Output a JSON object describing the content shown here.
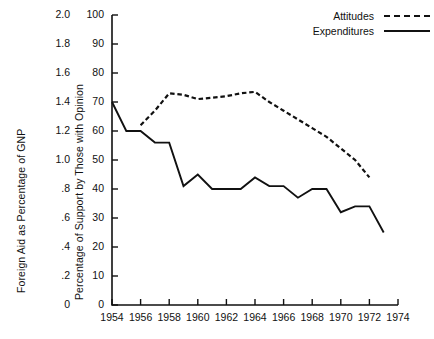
{
  "chart_data": {
    "type": "line",
    "title": "",
    "xlabel": "",
    "ylabel": "Foreign Aid as Percentage of GNP",
    "ylabel_right": "Percentage of Support by Those with Opinion",
    "x": [
      1954,
      1955,
      1956,
      1957,
      1958,
      1959,
      1960,
      1961,
      1962,
      1963,
      1964,
      1965,
      1966,
      1967,
      1968,
      1969,
      1970,
      1971,
      1972,
      1973,
      1974
    ],
    "xlim": [
      1954,
      1974
    ],
    "xticks": [
      "1954",
      "1956",
      "1958",
      "1960",
      "1962",
      "1964",
      "1966",
      "1968",
      "1970",
      "1972",
      "1974"
    ],
    "xtick_values": [
      1954,
      1956,
      1958,
      1960,
      1962,
      1964,
      1966,
      1968,
      1970,
      1972,
      1974
    ],
    "yticks_left": [
      "2.0",
      "1.8",
      "1.6",
      "1.4",
      "1.2",
      "1.0",
      ".8",
      ".6",
      ".4",
      ".2",
      "0"
    ],
    "ytick_values_left": [
      2.0,
      1.8,
      1.6,
      1.4,
      1.2,
      1.0,
      0.8,
      0.6,
      0.4,
      0.2,
      0
    ],
    "ylim_left": [
      0,
      2.0
    ],
    "yticks_right": [
      "100",
      "90",
      "80",
      "70",
      "60",
      "50",
      "40",
      "30",
      "20",
      "10",
      "0"
    ],
    "ytick_values_right": [
      100,
      90,
      80,
      70,
      60,
      50,
      40,
      30,
      20,
      10,
      0
    ],
    "ylim_right": [
      0,
      100
    ],
    "grid": false,
    "legend_position": "top-right",
    "series": [
      {
        "name": "Attitudes",
        "style": "dashed",
        "color": "#111111",
        "axis": "right",
        "x": [
          1956,
          1957,
          1958,
          1959,
          1960,
          1961,
          1962,
          1963,
          1964,
          1965,
          1966,
          1967,
          1968,
          1969,
          1970,
          1971,
          1972
        ],
        "values": [
          62,
          67,
          73,
          72.5,
          71,
          71.5,
          72,
          73,
          73.5,
          70,
          67,
          64,
          61,
          58,
          54,
          50,
          44
        ]
      },
      {
        "name": "Expenditures",
        "style": "solid",
        "color": "#111111",
        "axis": "right",
        "x": [
          1954,
          1955,
          1956,
          1957,
          1958,
          1959,
          1960,
          1961,
          1962,
          1963,
          1964,
          1965,
          1966,
          1967,
          1968,
          1969,
          1970,
          1971,
          1972,
          1973
        ],
        "values": [
          70,
          60,
          60,
          56,
          56,
          41,
          45,
          40,
          40,
          40,
          44,
          41,
          41,
          37,
          40,
          40,
          32,
          34,
          34,
          25
        ]
      }
    ],
    "legend": [
      {
        "label": "Attitudes",
        "style": "dashed"
      },
      {
        "label": "Expenditures",
        "style": "solid"
      }
    ]
  }
}
